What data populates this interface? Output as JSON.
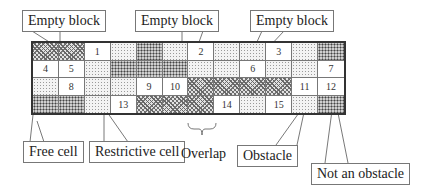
{
  "labels": {
    "empty_block_1": "Empty block",
    "empty_block_2": "Empty block",
    "empty_block_3": "Empty block",
    "free_cell": "Free cell",
    "restrictive_cell": "Restrictive cell",
    "overlap": "Overlap",
    "obstacle": "Obstacle",
    "not_an_obstacle": "Not an obstacle"
  },
  "legend_patterns": {
    "W": "free cell (white)",
    "L": "restrictive cell (light dots)",
    "D": "dark dotted block",
    "H": "cross-hatched block"
  },
  "grid": {
    "columns": 12,
    "rows": 4,
    "cells": [
      [
        {
          "p": "H",
          "n": ""
        },
        {
          "p": "H",
          "n": ""
        },
        {
          "p": "W",
          "n": "1"
        },
        {
          "p": "L",
          "n": ""
        },
        {
          "p": "D",
          "n": ""
        },
        {
          "p": "L",
          "n": ""
        },
        {
          "p": "W",
          "n": "2"
        },
        {
          "p": "L",
          "n": ""
        },
        {
          "p": "L",
          "n": ""
        },
        {
          "p": "W",
          "n": "3"
        },
        {
          "p": "L",
          "n": ""
        },
        {
          "p": "D",
          "n": ""
        }
      ],
      [
        {
          "p": "W",
          "n": "4"
        },
        {
          "p": "W",
          "n": "5"
        },
        {
          "p": "L",
          "n": ""
        },
        {
          "p": "D",
          "n": ""
        },
        {
          "p": "D",
          "n": ""
        },
        {
          "p": "D",
          "n": ""
        },
        {
          "p": "L",
          "n": ""
        },
        {
          "p": "L",
          "n": ""
        },
        {
          "p": "W",
          "n": "6"
        },
        {
          "p": "L",
          "n": ""
        },
        {
          "p": "L",
          "n": ""
        },
        {
          "p": "W",
          "n": "7"
        }
      ],
      [
        {
          "p": "L",
          "n": ""
        },
        {
          "p": "W",
          "n": "8"
        },
        {
          "p": "L",
          "n": ""
        },
        {
          "p": "L",
          "n": ""
        },
        {
          "p": "W",
          "n": "9"
        },
        {
          "p": "W",
          "n": "10"
        },
        {
          "p": "H",
          "n": ""
        },
        {
          "p": "H",
          "n": ""
        },
        {
          "p": "H",
          "n": ""
        },
        {
          "p": "H",
          "n": ""
        },
        {
          "p": "W",
          "n": "11"
        },
        {
          "p": "W",
          "n": "12"
        }
      ],
      [
        {
          "p": "D",
          "n": ""
        },
        {
          "p": "D",
          "n": ""
        },
        {
          "p": "L",
          "n": ""
        },
        {
          "p": "W",
          "n": "13"
        },
        {
          "p": "H",
          "n": ""
        },
        {
          "p": "H",
          "n": ""
        },
        {
          "p": "H",
          "n": ""
        },
        {
          "p": "W",
          "n": "14"
        },
        {
          "p": "L",
          "n": ""
        },
        {
          "p": "W",
          "n": "15"
        },
        {
          "p": "L",
          "n": ""
        },
        {
          "p": "D",
          "n": ""
        }
      ]
    ]
  }
}
